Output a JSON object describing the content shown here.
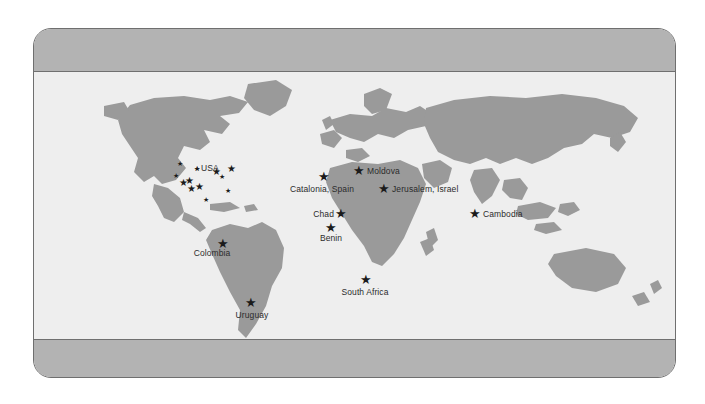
{
  "figure": {
    "kind": "world-map",
    "frame": {
      "header_fill": "#b3b3b3",
      "footer_fill": "#b3b3b3",
      "border": "#6f6f6f"
    },
    "map": {
      "land_fill": "#9a9a9a",
      "ocean_fill": "#eeeeee",
      "marker_color": "#1b1b1b"
    }
  },
  "locations": [
    {
      "id": "usa",
      "label": "USA",
      "label_side": "right",
      "x": 201,
      "y": 168,
      "star": "small",
      "star_x": 197,
      "star_y": 168
    },
    {
      "id": "colombia",
      "label": "Colombia",
      "label_side": "center",
      "x": 212,
      "y": 253,
      "star": "big",
      "star_x": 223,
      "star_y": 243
    },
    {
      "id": "uruguay",
      "label": "Uruguay",
      "label_side": "center",
      "x": 252,
      "y": 315,
      "star": "big",
      "star_x": 251,
      "star_y": 302
    },
    {
      "id": "catalonia-spain",
      "label": "Catalonia, Spain",
      "label_side": "center",
      "x": 322,
      "y": 189,
      "star": "big",
      "star_x": 324,
      "star_y": 176
    },
    {
      "id": "moldova",
      "label": "Moldova",
      "label_side": "right",
      "x": 367,
      "y": 171,
      "star": "big",
      "star_x": 359,
      "star_y": 170
    },
    {
      "id": "jerusalem-israel",
      "label": "Jerusalem, Israel",
      "label_side": "right",
      "x": 392,
      "y": 189,
      "star": "big",
      "star_x": 384,
      "star_y": 188
    },
    {
      "id": "chad",
      "label": "Chad",
      "label_side": "left",
      "x": 334,
      "y": 214,
      "star": "big",
      "star_x": 341,
      "star_y": 213
    },
    {
      "id": "benin",
      "label": "Benin",
      "label_side": "center",
      "x": 331,
      "y": 238,
      "star": "big",
      "star_x": 331,
      "star_y": 227
    },
    {
      "id": "south-africa",
      "label": "South Africa",
      "label_side": "center",
      "x": 365,
      "y": 292,
      "star": "big",
      "star_x": 366,
      "star_y": 279
    },
    {
      "id": "cambodia",
      "label": "Cambodia",
      "label_side": "right",
      "x": 483,
      "y": 214,
      "star": "big",
      "star_x": 475,
      "star_y": 213
    }
  ],
  "usa_cluster": [
    {
      "x": 180,
      "y": 163,
      "size": "small"
    },
    {
      "x": 176,
      "y": 175,
      "size": "small"
    },
    {
      "x": 183,
      "y": 183,
      "size": "mid"
    },
    {
      "x": 189,
      "y": 181,
      "size": "mid"
    },
    {
      "x": 191,
      "y": 189,
      "size": "mid"
    },
    {
      "x": 199,
      "y": 187,
      "size": "mid"
    },
    {
      "x": 197,
      "y": 168,
      "size": "small"
    },
    {
      "x": 216,
      "y": 172,
      "size": "mid"
    },
    {
      "x": 222,
      "y": 176,
      "size": "small"
    },
    {
      "x": 231,
      "y": 169,
      "size": "mid"
    },
    {
      "x": 206,
      "y": 199,
      "size": "small"
    },
    {
      "x": 228,
      "y": 190,
      "size": "small"
    }
  ]
}
